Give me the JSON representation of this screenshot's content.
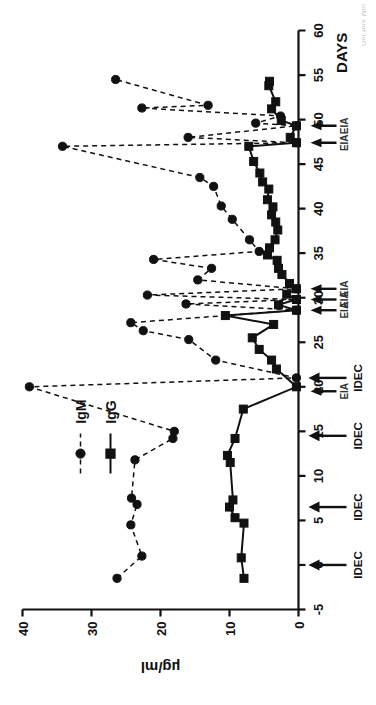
{
  "figure": {
    "orientation_note": "rotated-90-ccw",
    "caption_edge_fragment": "IgM and IgG"
  },
  "axes": {
    "x_title": "DAYS",
    "y_title": "µg/ml",
    "x_ticks": [
      "-5",
      "0",
      "5",
      "10",
      "15",
      "20",
      "25",
      "30",
      "35",
      "40",
      "45",
      "50",
      "55",
      "60"
    ],
    "y_ticks": [
      "0",
      "10",
      "20",
      "30",
      "40"
    ]
  },
  "legend": {
    "items": [
      {
        "label": "IgM",
        "marker": "circle",
        "line": "dashed",
        "color": "#111111"
      },
      {
        "label": "IgG",
        "marker": "square",
        "line": "solid",
        "color": "#111111"
      }
    ]
  },
  "annotations": [
    {
      "label": "IDEC",
      "day": 0
    },
    {
      "label": "IDEC",
      "day": 6.5
    },
    {
      "label": "IDEC",
      "day": 14.5
    },
    {
      "label": "IDEC",
      "day": 21
    },
    {
      "label": "EIA",
      "day": 19.5
    },
    {
      "label": "EIA",
      "day": 28.6
    },
    {
      "label": "EIA",
      "day": 29.8
    },
    {
      "label": "EIA",
      "day": 31
    },
    {
      "label": "EIA",
      "day": 47.4
    },
    {
      "label": "EIA",
      "day": 49.3
    }
  ],
  "chart_data": {
    "type": "line",
    "title": "",
    "xlabel": "DAYS",
    "ylabel": "µg/ml",
    "xlim": [
      -5,
      60
    ],
    "ylim": [
      0,
      40
    ],
    "grid": false,
    "legend_position": "upper-left",
    "series": [
      {
        "name": "IgM",
        "marker": "circle",
        "line": "dashed",
        "points": [
          [
            -1.5,
            26.3
          ],
          [
            1.0,
            22.7
          ],
          [
            4.5,
            24.3
          ],
          [
            6.8,
            23.4
          ],
          [
            7.5,
            24.2
          ],
          [
            11.8,
            23.7
          ],
          [
            14.2,
            18.2
          ],
          [
            15.0,
            18.0
          ],
          [
            20.0,
            39.0
          ],
          [
            21.0,
            0.3
          ],
          [
            23.0,
            12.0
          ],
          [
            25.3,
            15.9
          ],
          [
            26.3,
            22.5
          ],
          [
            27.2,
            24.3
          ],
          [
            28.6,
            0.3
          ],
          [
            29.3,
            16.3
          ],
          [
            29.8,
            0.3
          ],
          [
            30.3,
            21.9
          ],
          [
            31.0,
            0.3
          ],
          [
            32.0,
            14.6
          ],
          [
            33.3,
            12.6
          ],
          [
            34.3,
            21.0
          ],
          [
            35.2,
            5.7
          ],
          [
            36.5,
            7.1
          ],
          [
            38.8,
            9.6
          ],
          [
            40.3,
            11.2
          ],
          [
            42.5,
            12.3
          ],
          [
            43.5,
            14.3
          ],
          [
            47.0,
            34.2
          ],
          [
            47.4,
            0.3
          ],
          [
            48.0,
            16.0
          ],
          [
            49.3,
            0.3
          ],
          [
            49.6,
            6.2
          ],
          [
            50.4,
            2.6
          ],
          [
            51.3,
            22.7
          ],
          [
            51.6,
            13.1
          ],
          [
            54.5,
            26.5
          ]
        ]
      },
      {
        "name": "IgG",
        "marker": "square",
        "line": "solid",
        "points": [
          [
            -1.5,
            7.9
          ],
          [
            0.8,
            8.3
          ],
          [
            4.7,
            7.9
          ],
          [
            5.3,
            9.2
          ],
          [
            6.5,
            10.0
          ],
          [
            7.3,
            9.5
          ],
          [
            11.5,
            9.9
          ],
          [
            12.3,
            10.3
          ],
          [
            14.2,
            9.2
          ],
          [
            17.5,
            8.0
          ],
          [
            20.0,
            0.3
          ],
          [
            22.0,
            3.2
          ],
          [
            23.0,
            3.9
          ],
          [
            24.2,
            5.7
          ],
          [
            25.5,
            6.7
          ],
          [
            27.0,
            3.6
          ],
          [
            28.0,
            10.6
          ],
          [
            28.6,
            0.3
          ],
          [
            29.2,
            2.9
          ],
          [
            29.8,
            0.3
          ],
          [
            30.4,
            1.7
          ],
          [
            31.0,
            0.3
          ],
          [
            31.6,
            1.3
          ],
          [
            32.6,
            2.4
          ],
          [
            33.3,
            2.9
          ],
          [
            34.2,
            3.1
          ],
          [
            34.8,
            4.5
          ],
          [
            35.6,
            4.2
          ],
          [
            36.5,
            3.4
          ],
          [
            37.6,
            3.0
          ],
          [
            38.5,
            3.3
          ],
          [
            39.3,
            3.9
          ],
          [
            40.2,
            3.7
          ],
          [
            41.0,
            4.5
          ],
          [
            42.2,
            4.3
          ],
          [
            43.0,
            5.2
          ],
          [
            44.0,
            5.6
          ],
          [
            45.3,
            6.5
          ],
          [
            47.0,
            7.2
          ],
          [
            47.4,
            0.3
          ],
          [
            48.0,
            1.2
          ],
          [
            49.3,
            0.3
          ],
          [
            49.9,
            2.5
          ],
          [
            51.2,
            3.9
          ],
          [
            52.0,
            3.3
          ],
          [
            53.8,
            4.3
          ],
          [
            54.3,
            4.2
          ]
        ]
      }
    ]
  }
}
